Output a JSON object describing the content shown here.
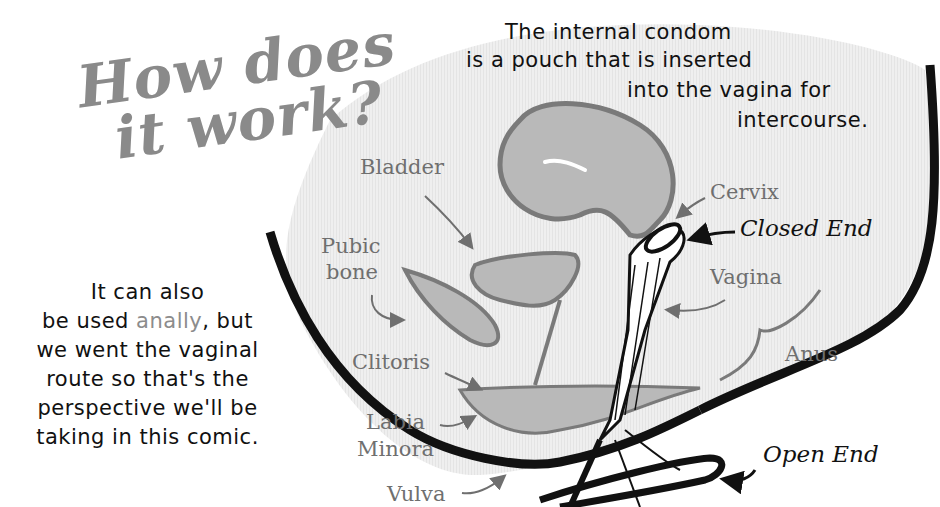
{
  "title": {
    "line1": "How does",
    "line2": "it work?"
  },
  "caption_top": {
    "line1": "The internal condom",
    "line2": "is a pouch that is inserted",
    "line3": "into the vagina for",
    "line4": "intercourse."
  },
  "caption_left": {
    "line1": "It can also",
    "line2_prefix": "be used ",
    "line2_accent": "anally",
    "line2_suffix": ", but",
    "line3": "we went the vaginal",
    "line4": "route so that's the",
    "line5": "perspective we'll be",
    "line6": "taking in this comic."
  },
  "labels": {
    "bladder": "Bladder",
    "pubic_bone_1": "Pubic",
    "pubic_bone_2": "bone",
    "clitoris": "Clitoris",
    "labia_1": "Labia",
    "labia_2": "Minora",
    "vulva": "Vulva",
    "cervix": "Cervix",
    "closed_end": "Closed End",
    "vagina": "Vagina",
    "anus": "Anus",
    "open_end": "Open End"
  },
  "colors": {
    "background": "#ffffff",
    "panel": "#eeeeee",
    "organ_fill": "#b9b9b9",
    "organ_stroke": "#7a7a7a",
    "outline": "#111111",
    "title": "#8a8a8a",
    "label": "#6f6f6f"
  }
}
